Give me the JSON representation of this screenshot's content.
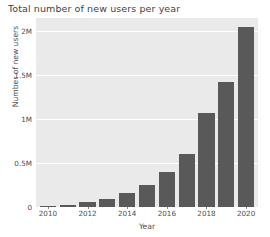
{
  "chart_data": {
    "type": "bar",
    "title": "Total number of new users per year",
    "xlabel": "Year",
    "ylabel": "Number of new users",
    "categories": [
      2010,
      2011,
      2012,
      2013,
      2014,
      2015,
      2016,
      2017,
      2018,
      2019,
      2020
    ],
    "values": [
      10000,
      25000,
      55000,
      95000,
      160000,
      255000,
      400000,
      600000,
      1070000,
      1420000,
      2050000
    ],
    "xtick_labels": [
      "2010",
      "2012",
      "2014",
      "2016",
      "2018",
      "2020"
    ],
    "xtick_values": [
      2010,
      2012,
      2014,
      2016,
      2018,
      2020
    ],
    "ytick_labels": [
      "0",
      "0.5M",
      "1M",
      "1.5M",
      "2M"
    ],
    "ytick_values": [
      0,
      500000,
      1000000,
      1500000,
      2000000
    ],
    "ylim": [
      0,
      2150000
    ],
    "xlim": [
      2009.4,
      2020.6
    ],
    "grid": true,
    "legend": false,
    "bar_color": "#595959",
    "plot_background": "#eaeaea",
    "grid_color": "#ffffff",
    "figure_background": "#ffffff"
  }
}
